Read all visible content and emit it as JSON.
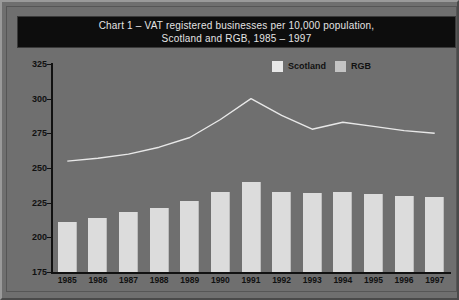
{
  "chart_data": {
    "type": "bar",
    "title": "Chart 1 – VAT registered businesses per 10,000 population, Scotland and RGB, 1985 – 1997",
    "title_line1": "Chart 1 – VAT registered businesses per 10,000 population,",
    "title_line2": "Scotland and RGB, 1985 – 1997",
    "xlabel": "",
    "ylabel": "",
    "ylim": [
      175,
      325
    ],
    "yticks": [
      175,
      200,
      225,
      250,
      275,
      300,
      325
    ],
    "grid": false,
    "legend_position": "top-right",
    "categories": [
      "1985",
      "1986",
      "1987",
      "1988",
      "1989",
      "1990",
      "1991",
      "1992",
      "1993",
      "1994",
      "1995",
      "1996",
      "1997"
    ],
    "series": [
      {
        "name": "Scotland",
        "type": "bar",
        "color": "#dcdcdc",
        "values": [
          211,
          214,
          218,
          221,
          226,
          233,
          240,
          233,
          232,
          233,
          231,
          230,
          229
        ]
      },
      {
        "name": "RGB",
        "type": "line",
        "color": "#e8e8e8",
        "values": [
          255,
          257,
          260,
          265,
          272,
          285,
          300,
          288,
          278,
          283,
          280,
          277,
          275
        ]
      }
    ]
  },
  "legend": {
    "items": [
      {
        "label": "Scotland",
        "color": "#e8e8e8"
      },
      {
        "label": "RGB",
        "color": "#c4c4c4"
      }
    ]
  },
  "footnote": {
    "text": ""
  }
}
